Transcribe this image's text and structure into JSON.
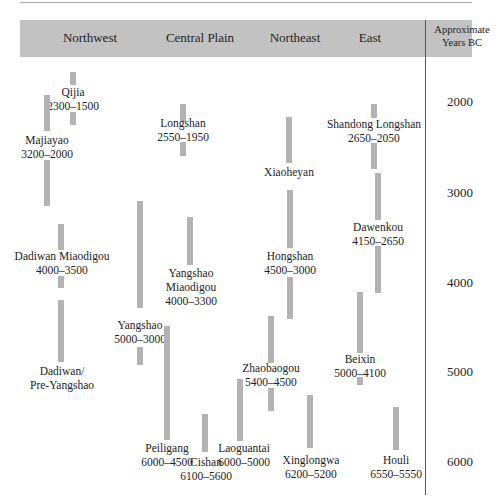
{
  "columns": [
    "Northwest",
    "Central Plain",
    "Northeast",
    "East"
  ],
  "axis": {
    "title_line1": "Approximate",
    "title_line2": "Years BC",
    "ticks": [
      "2000",
      "3000",
      "4000",
      "5000",
      "6000"
    ]
  },
  "cultures": [
    {
      "id": "qijia",
      "region": "Northwest",
      "name": "Qijia",
      "dates": "2300–1500",
      "start_bc": 2300,
      "end_bc": 1500
    },
    {
      "id": "majiayao",
      "region": "Northwest",
      "name": "Majiayao",
      "dates": "3200–2000",
      "start_bc": 3200,
      "end_bc": 2000
    },
    {
      "id": "dadiwan-miaodigou",
      "region": "Northwest",
      "name": "Dadiwan Miaodigou",
      "dates": "4000–3500",
      "start_bc": 4000,
      "end_bc": 3500
    },
    {
      "id": "dadiwan-pre-yangshao",
      "region": "Northwest",
      "name_line1": "Dadiwan/",
      "name_line2": "Pre-Yangshao"
    },
    {
      "id": "longshan",
      "region": "Central Plain",
      "name": "Longshan",
      "dates": "2550–1950",
      "start_bc": 2550,
      "end_bc": 1950
    },
    {
      "id": "yangshao",
      "region": "Central Plain",
      "name": "Yangshao",
      "dates": "5000–3000",
      "start_bc": 5000,
      "end_bc": 3000
    },
    {
      "id": "yangshao-miaodigou",
      "region": "Central Plain",
      "name_line1": "Yangshao",
      "name_line2": "Miaodigou",
      "dates": "4000–3300",
      "start_bc": 4000,
      "end_bc": 3300
    },
    {
      "id": "peiligang",
      "region": "Central Plain",
      "name": "Peiligang",
      "dates": "6000–4500",
      "start_bc": 6000,
      "end_bc": 4500
    },
    {
      "id": "cishan",
      "region": "Central Plain",
      "name": "Cishan",
      "dates": "6100–5600",
      "start_bc": 6100,
      "end_bc": 5600
    },
    {
      "id": "laoguantai",
      "region": "Central Plain",
      "name": "Laoguantai",
      "dates": "6000–5000",
      "start_bc": 6000,
      "end_bc": 5000
    },
    {
      "id": "xiaoheyan",
      "region": "Northeast",
      "name": "Xiaoheyan"
    },
    {
      "id": "hongshan",
      "region": "Northeast",
      "name": "Hongshan",
      "dates": "4500–3000",
      "start_bc": 4500,
      "end_bc": 3000
    },
    {
      "id": "zhaobaogou",
      "region": "Northeast",
      "name": "Zhaobaogou",
      "dates": "5400–4500",
      "start_bc": 5400,
      "end_bc": 4500
    },
    {
      "id": "xinglongwa",
      "region": "Northeast",
      "name": "Xinglongwa",
      "dates": "6200–5200",
      "start_bc": 6200,
      "end_bc": 5200
    },
    {
      "id": "shandong-longshan",
      "region": "East",
      "name": "Shandong Longshan",
      "dates": "2650–2050",
      "start_bc": 2650,
      "end_bc": 2050
    },
    {
      "id": "dawenkou",
      "region": "East",
      "name": "Dawenkou",
      "dates": "4150–2650",
      "start_bc": 4150,
      "end_bc": 2650
    },
    {
      "id": "beixin",
      "region": "East",
      "name": "Beixin",
      "dates": "5000–4100",
      "start_bc": 5000,
      "end_bc": 4100
    },
    {
      "id": "houli",
      "region": "East",
      "name": "Houli",
      "dates": "6550–5550",
      "start_bc": 6550,
      "end_bc": 5550
    }
  ]
}
